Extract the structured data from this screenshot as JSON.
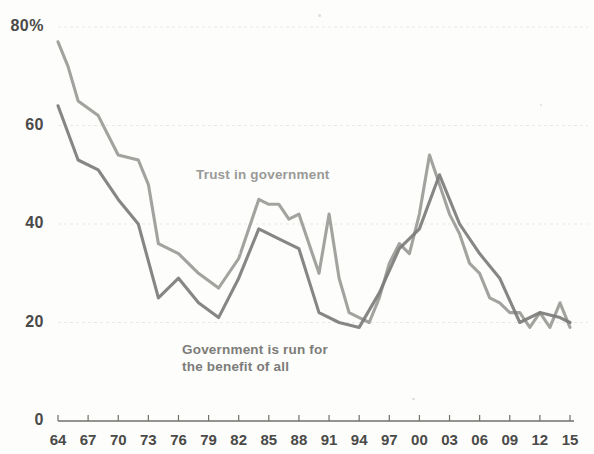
{
  "chart_data": {
    "type": "line",
    "title": "",
    "xlabel": "",
    "ylabel": "",
    "ylim": [
      0,
      80
    ],
    "xlim": [
      1964,
      2015
    ],
    "grid": true,
    "legend_position": "inline-annotation",
    "y_ticks": [
      "0",
      "20",
      "40",
      "60",
      "80%"
    ],
    "y_tick_values": [
      0,
      20,
      40,
      60,
      80
    ],
    "x_ticks": [
      "64",
      "67",
      "70",
      "73",
      "76",
      "79",
      "82",
      "85",
      "88",
      "91",
      "94",
      "97",
      "00",
      "03",
      "06",
      "09",
      "12",
      "15"
    ],
    "x_tick_values": [
      1964,
      1967,
      1970,
      1973,
      1976,
      1979,
      1982,
      1985,
      1988,
      1991,
      1994,
      1997,
      2000,
      2003,
      2006,
      2009,
      2012,
      2015
    ],
    "series": [
      {
        "name": "Trust in government",
        "color": "#9a9a97",
        "label_text": "Trust in government",
        "x": [
          1964,
          1965,
          1966,
          1968,
          1970,
          1972,
          1973,
          1974,
          1976,
          1978,
          1980,
          1982,
          1984,
          1985,
          1986,
          1987,
          1988,
          1990,
          1991,
          1992,
          1993,
          1994,
          1995,
          1996,
          1997,
          1998,
          1999,
          2000,
          2001,
          2002,
          2003,
          2004,
          2005,
          2006,
          2007,
          2008,
          2009,
          2010,
          2011,
          2012,
          2013,
          2014,
          2015
        ],
        "values": [
          77,
          72,
          65,
          62,
          54,
          53,
          48,
          36,
          34,
          30,
          27,
          33,
          45,
          44,
          44,
          41,
          42,
          30,
          42,
          29,
          22,
          21,
          20,
          25,
          32,
          36,
          34,
          42,
          54,
          48,
          42,
          38,
          32,
          30,
          25,
          24,
          22,
          22,
          19,
          22,
          19,
          24,
          19
        ]
      },
      {
        "name": "Government is run for the benefit of all",
        "color": "#7c7c79",
        "label_text": "Government is run for\nthe benefit of all",
        "x": [
          1964,
          1966,
          1968,
          1970,
          1972,
          1974,
          1976,
          1978,
          1980,
          1982,
          1984,
          1986,
          1988,
          1990,
          1992,
          1994,
          1996,
          1998,
          2000,
          2002,
          2004,
          2006,
          2008,
          2010,
          2012,
          2014,
          2015
        ],
        "values": [
          64,
          53,
          51,
          45,
          40,
          25,
          29,
          24,
          21,
          29,
          39,
          37,
          35,
          22,
          20,
          19,
          26,
          35,
          39,
          50,
          40,
          34,
          29,
          20,
          22,
          21,
          20
        ]
      }
    ],
    "annotations": [
      {
        "text": "Trust in government",
        "x": 1983,
        "y": 47
      },
      {
        "text": "Government is run for the benefit of all",
        "x": 1982,
        "y": 12
      }
    ]
  },
  "axis": {
    "y_axis_name": "percent-axis",
    "x_axis_name": "year-axis"
  }
}
